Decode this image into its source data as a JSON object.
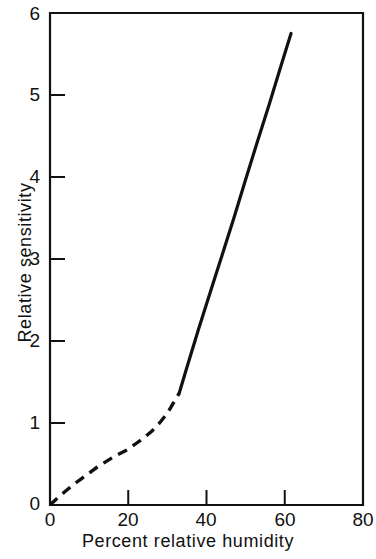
{
  "chart_data": {
    "type": "line",
    "title": "",
    "xlabel": "Percent relative humidity",
    "ylabel": "Relative sensitivity",
    "xlim": [
      0,
      80
    ],
    "ylim": [
      0,
      6
    ],
    "xticks": [
      "0",
      "20",
      "40",
      "60",
      "80"
    ],
    "xtick_values": [
      0,
      20,
      40,
      60,
      80
    ],
    "yticks": [
      "0",
      "1",
      "2",
      "3",
      "4",
      "5",
      "6"
    ],
    "ytick_values": [
      0,
      1,
      2,
      3,
      4,
      5,
      6
    ],
    "grid": false,
    "legend": "none",
    "line_color": "#111111",
    "series": [
      {
        "name": "Relative sensitivity (extrapolated)",
        "style": "dashed",
        "x": [
          0,
          2,
          4,
          6,
          8,
          10,
          12,
          14,
          16,
          18,
          20,
          22,
          24,
          26,
          28,
          30,
          32,
          33
        ],
        "y": [
          0.0,
          0.09,
          0.17,
          0.25,
          0.32,
          0.39,
          0.46,
          0.52,
          0.58,
          0.63,
          0.68,
          0.75,
          0.82,
          0.9,
          1.0,
          1.12,
          1.28,
          1.36
        ]
      },
      {
        "name": "Relative sensitivity (measured)",
        "style": "solid",
        "x": [
          33,
          35,
          38,
          41,
          44,
          47,
          50,
          53,
          56,
          59,
          61.6
        ],
        "y": [
          1.36,
          1.68,
          2.15,
          2.6,
          3.05,
          3.5,
          3.97,
          4.43,
          4.88,
          5.35,
          5.75
        ]
      }
    ]
  }
}
